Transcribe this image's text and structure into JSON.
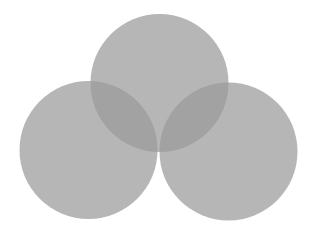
{
  "diagram": {
    "type": "venn",
    "background": "#ffffff",
    "fill_color": "#9a9a9a",
    "fill_opacity": 0.72,
    "circles": [
      {
        "id": "top",
        "cx": 159.5,
        "cy": 83,
        "r": 69
      },
      {
        "id": "left",
        "cx": 88.5,
        "cy": 150,
        "r": 69
      },
      {
        "id": "right",
        "cx": 228.5,
        "cy": 151.5,
        "r": 69
      }
    ]
  }
}
